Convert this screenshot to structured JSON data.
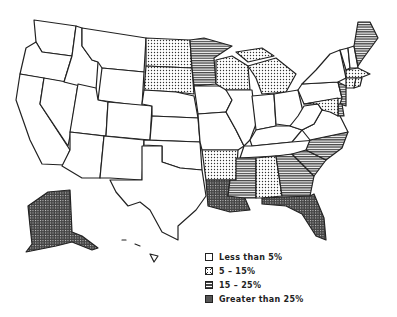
{
  "map": {
    "title": "",
    "region": "United States",
    "categories": [
      {
        "id": "c1",
        "label": "Less than 5%",
        "pattern": "white"
      },
      {
        "id": "c2",
        "label": "5 – 15%",
        "pattern": "dots"
      },
      {
        "id": "c3",
        "label": "15 – 25%",
        "pattern": "horizontal-stripes"
      },
      {
        "id": "c4",
        "label": "Greater than 25%",
        "pattern": "dense-crosshatch"
      }
    ],
    "states": {
      "WA": "c1",
      "OR": "c1",
      "CA": "c1",
      "ID": "c1",
      "NV": "c1",
      "MT": "c1",
      "WY": "c1",
      "UT": "c1",
      "AZ": "c1",
      "CO": "c1",
      "NM": "c1",
      "ND": "c2",
      "SD": "c2",
      "NE": "c1",
      "KS": "c1",
      "OK": "c1",
      "TX": "c1",
      "MN": "c3",
      "IA": "c1",
      "MO": "c1",
      "AR": "c2",
      "LA": "c4",
      "WI": "c2",
      "IL": "c1",
      "MI": "c2",
      "IN": "c1",
      "OH": "c1",
      "KY": "c1",
      "TN": "c1",
      "MS": "c3",
      "AL": "c2",
      "GA": "c3",
      "FL": "c4",
      "SC": "c3",
      "NC": "c3",
      "VA": "c1",
      "WV": "c1",
      "PA": "c1",
      "NY": "c1",
      "VT": "c1",
      "NH": "c1",
      "ME": "c3",
      "MA": "c2",
      "RI": "c2",
      "CT": "c2",
      "NJ": "c3",
      "DE": "c3",
      "MD": "c2",
      "AK": "c4",
      "HI": "c1"
    }
  },
  "legend": {
    "items": [
      {
        "label": "Less than 5%"
      },
      {
        "label": "5 – 15%"
      },
      {
        "label": "15 – 25%"
      },
      {
        "label": "Greater than 25%"
      }
    ]
  }
}
